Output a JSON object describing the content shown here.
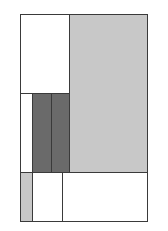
{
  "diagram": {
    "type": "rectangle-partition",
    "colors": {
      "white": "#ffffff",
      "light_gray": "#c8c8c8",
      "dark_gray": "#6a6a6a",
      "border": "#3a3a3a"
    },
    "cells": [
      {
        "id": "top-left-white",
        "x": 20,
        "y": 14,
        "w": 49,
        "h": 79,
        "fill": "#ffffff"
      },
      {
        "id": "right-light-gray",
        "x": 69,
        "y": 14,
        "w": 78,
        "h": 158,
        "fill": "#c8c8c8"
      },
      {
        "id": "mid-left-white-strip",
        "x": 20,
        "y": 93,
        "w": 12,
        "h": 79,
        "fill": "#ffffff"
      },
      {
        "id": "dark-bar-1",
        "x": 32,
        "y": 93,
        "w": 19,
        "h": 79,
        "fill": "#6a6a6a"
      },
      {
        "id": "dark-bar-2",
        "x": 51,
        "y": 93,
        "w": 18,
        "h": 79,
        "fill": "#6a6a6a"
      },
      {
        "id": "bottom-left-light-gray",
        "x": 20,
        "y": 172,
        "w": 12,
        "h": 49,
        "fill": "#c8c8c8"
      },
      {
        "id": "bottom-mid-white",
        "x": 32,
        "y": 172,
        "w": 30,
        "h": 49,
        "fill": "#ffffff"
      },
      {
        "id": "bottom-right-white",
        "x": 62,
        "y": 172,
        "w": 85,
        "h": 49,
        "fill": "#ffffff"
      }
    ]
  }
}
